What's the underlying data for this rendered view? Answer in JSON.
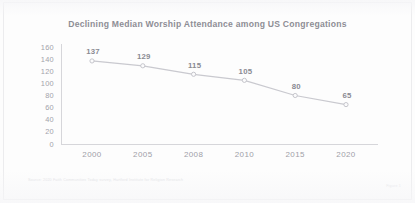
{
  "chart_data": {
    "type": "line",
    "title": "Declining Median Worship Attendance among US Congregations",
    "xlabel": "",
    "ylabel": "",
    "categories": [
      "2000",
      "2005",
      "2008",
      "2010",
      "2015",
      "2020"
    ],
    "values": [
      137,
      129,
      115,
      105,
      80,
      65
    ],
    "point_labels": [
      "137",
      "129",
      "115",
      "105",
      "80",
      "65"
    ],
    "yticks": [
      160,
      140,
      120,
      100,
      80,
      60,
      40,
      20,
      0
    ],
    "ytick_labels": [
      "160",
      "140",
      "120",
      "100",
      "80",
      "60",
      "40",
      "20",
      "0"
    ],
    "ylim": [
      0,
      160
    ],
    "grid": false,
    "legend": false,
    "series": [
      {
        "name": "Median worship attendance",
        "values": [
          137,
          129,
          115,
          105,
          80,
          65
        ]
      }
    ],
    "colors": {
      "line": "#c9c9cf",
      "marker_fill": "#fbfbfc",
      "marker_stroke": "#bfbfc6",
      "axis": "#d6d6da",
      "title_text": "#8e8e95",
      "tick_text": "#a3a3ab",
      "label_text": "#8a8a92",
      "background": "#fdfdfd"
    }
  },
  "footer": {
    "source_note": "Source: 2020 Faith Communities Today survey, Hartford Institute for Religion Research",
    "figure_caption": "Figure 1"
  }
}
